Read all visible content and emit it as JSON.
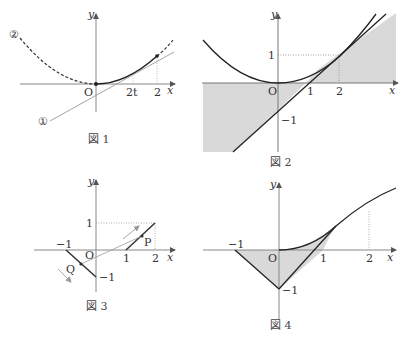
{
  "figures": [
    {
      "caption": "図 1",
      "axis_x": "x",
      "axis_y": "y",
      "origin": "O",
      "x_ticks": [
        "2t",
        "2"
      ],
      "curve_labels": [
        "①",
        "②"
      ]
    },
    {
      "caption": "図 2",
      "axis_x": "x",
      "axis_y": "y",
      "origin": "O",
      "x_ticks": [
        "1",
        "2"
      ],
      "y_ticks": [
        "1",
        "−1"
      ]
    },
    {
      "caption": "図 3",
      "axis_x": "x",
      "axis_y": "y",
      "origin": "O",
      "x_ticks": [
        "−1",
        "1",
        "2"
      ],
      "y_ticks": [
        "1",
        "−1"
      ],
      "points": [
        "P",
        "Q"
      ]
    },
    {
      "caption": "図 4",
      "axis_x": "x",
      "axis_y": "y",
      "origin": "O",
      "x_ticks": [
        "−1",
        "1",
        "2"
      ],
      "y_ticks": [
        "−1"
      ]
    }
  ],
  "colors": {
    "line": "#222222",
    "axis": "#555555",
    "shade": "#d9d9d9",
    "aux": "#888888"
  }
}
